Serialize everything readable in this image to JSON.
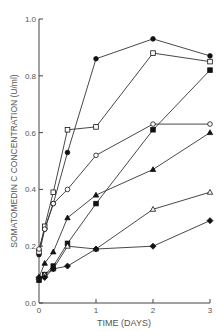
{
  "chart_data": {
    "type": "line",
    "title": "",
    "xlabel": "TIME (DAYS)",
    "ylabel": "SOMATOMEDIN C CONCENTRATION (U/ml)",
    "xlim": [
      0,
      3
    ],
    "ylim": [
      0,
      1.0
    ],
    "xticks": [
      "0",
      "1",
      "2",
      "3"
    ],
    "yticks": [
      "0.0",
      "0.2",
      "0.4",
      "0.6",
      "0.8",
      "1.0"
    ],
    "grid": false,
    "legend": "none",
    "x": [
      0,
      0.1,
      0.25,
      0.5,
      1,
      2,
      3
    ],
    "series": [
      {
        "name": "filled circle",
        "marker": "circle-filled",
        "values": [
          0.17,
          0.26,
          0.35,
          0.53,
          0.86,
          0.93,
          0.87
        ]
      },
      {
        "name": "open square",
        "marker": "square-open",
        "values": [
          0.18,
          0.27,
          0.39,
          0.61,
          0.62,
          0.88,
          0.85
        ]
      },
      {
        "name": "open circle",
        "marker": "circle-open",
        "values": [
          0.19,
          0.26,
          0.35,
          0.4,
          0.52,
          0.63,
          0.63
        ]
      },
      {
        "name": "filled triangle",
        "marker": "triangle-filled",
        "values": [
          0.09,
          0.14,
          0.18,
          0.3,
          0.38,
          0.47,
          0.6
        ]
      },
      {
        "name": "filled square",
        "marker": "square-filled",
        "values": [
          0.08,
          0.1,
          0.13,
          0.21,
          0.35,
          0.61,
          0.82
        ]
      },
      {
        "name": "open triangle",
        "marker": "triangle-open",
        "values": [
          0.09,
          0.1,
          0.12,
          0.2,
          0.19,
          0.33,
          0.39
        ]
      },
      {
        "name": "filled diamond",
        "marker": "diamond-filled",
        "values": [
          0.09,
          0.09,
          0.12,
          0.13,
          0.19,
          0.2,
          0.29
        ]
      }
    ]
  }
}
